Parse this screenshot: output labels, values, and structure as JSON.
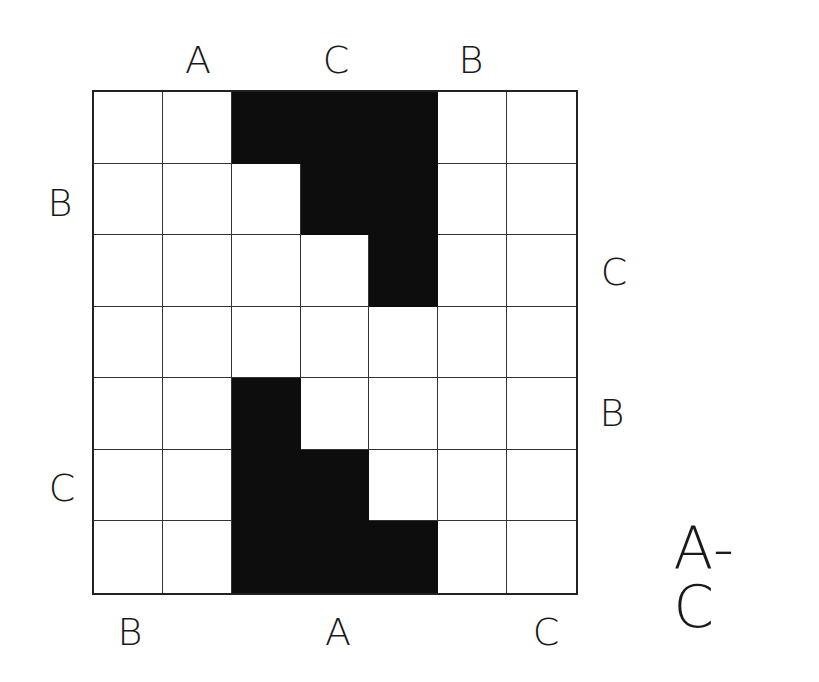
{
  "puzzle": {
    "title": "A-C",
    "rows": 7,
    "cols": 7,
    "filled_cells": [
      [
        0,
        2
      ],
      [
        0,
        3
      ],
      [
        0,
        4
      ],
      [
        1,
        3
      ],
      [
        1,
        4
      ],
      [
        2,
        4
      ],
      [
        4,
        2
      ],
      [
        5,
        2
      ],
      [
        5,
        3
      ],
      [
        6,
        2
      ],
      [
        6,
        3
      ],
      [
        6,
        4
      ]
    ],
    "colors": {
      "filled": "#0d0d0d",
      "empty": "#ffffff",
      "grid_line": "#333333"
    }
  },
  "labels": {
    "top": [
      {
        "text": "A",
        "x": 198,
        "y": 60
      },
      {
        "text": "C",
        "x": 336,
        "y": 60
      },
      {
        "text": "B",
        "x": 471,
        "y": 60
      }
    ],
    "left": [
      {
        "text": "B",
        "x": 60,
        "y": 203
      },
      {
        "text": "C",
        "x": 62,
        "y": 488
      }
    ],
    "right": [
      {
        "text": "C",
        "x": 614,
        "y": 272
      },
      {
        "text": "B",
        "x": 612,
        "y": 413
      }
    ],
    "bottom": [
      {
        "text": "B",
        "x": 130,
        "y": 632
      },
      {
        "text": "A",
        "x": 338,
        "y": 632
      },
      {
        "text": "C",
        "x": 546,
        "y": 632
      }
    ]
  }
}
